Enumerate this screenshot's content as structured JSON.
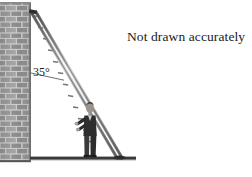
{
  "figure": {
    "caption": "Not drawn accurately",
    "angle_label": "35°",
    "angle_value": 35,
    "angle_unit": "degrees"
  },
  "colors": {
    "brick_face": "#9a9a9a",
    "brick_mortar": "#cfcfcf",
    "brick_dark": "#7d7d7d",
    "ground": "#3a3a3a",
    "ladder": "#6e6e6e",
    "ladder_dark": "#3f3f3f",
    "person_clothing": "#2e2e2e",
    "person_skin": "#b9b0a8",
    "text": "#1a1a1a",
    "background": "#ffffff"
  },
  "elements": {
    "wall_name": "brick wall",
    "ladder_name": "ladder",
    "person_name": "person holding ladder",
    "ground_name": "ground line",
    "angle_name": "angle between wall and ladder"
  }
}
